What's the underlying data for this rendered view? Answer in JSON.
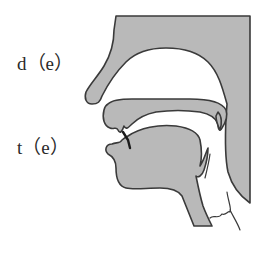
{
  "figure": {
    "labels": {
      "voiced": "d（e）",
      "voiceless": "t（e）"
    },
    "parts": [
      "upper-lip-nose",
      "hard-palate",
      "velum",
      "upper-teeth",
      "tongue",
      "lower-lip-jaw",
      "pharynx-wall",
      "epiglottis",
      "larynx"
    ],
    "colors": {
      "tissue_fill": "#b9b9b9",
      "outline": "#3a3a3a",
      "background": "#ffffff",
      "text": "#2a2a2a"
    }
  }
}
